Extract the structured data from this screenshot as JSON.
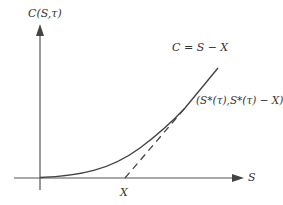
{
  "diagram": {
    "type": "option-value-curve",
    "y_axis": {
      "label": "C(S,τ)"
    },
    "x_axis": {
      "label": "S"
    },
    "strike": {
      "label": "X"
    },
    "payoff_line": {
      "label": "C = S − X",
      "style": "solid"
    },
    "tangent_line": {
      "style": "dashed"
    },
    "tangency_point": {
      "label": "(S*(τ),S*(τ) − X)"
    },
    "colors": {
      "axis": "#555555",
      "curve": "#444444",
      "text": "#333333",
      "background": "#ffffff"
    }
  }
}
